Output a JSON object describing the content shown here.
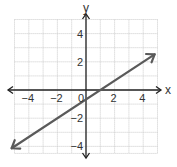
{
  "chart_data": {
    "type": "line",
    "title": "",
    "xlabel": "x",
    "ylabel": "y",
    "xlim": [
      -5,
      5
    ],
    "ylim": [
      -4.5,
      5
    ],
    "grid": true,
    "x_ticks_labeled": [
      -4,
      -2,
      0,
      2,
      4
    ],
    "y_ticks_labeled": [
      4,
      2,
      -2,
      -4
    ],
    "x_tick_labels": [
      "−4",
      "−2",
      "0",
      "2",
      "4"
    ],
    "y_tick_labels": [
      "4",
      "2",
      "−2",
      "−4"
    ],
    "series": [
      {
        "name": "line",
        "equation": "y = (2/3)x - 2/3",
        "slope": 0.6667,
        "intercept": -0.6667,
        "x": [
          -5.2,
          4.8
        ],
        "y": [
          -4.13,
          2.53
        ],
        "arrows_both_ends": true,
        "color": "#555555"
      }
    ],
    "annotations": [
      {
        "text": "0",
        "x": 0,
        "y": 0,
        "note": "origin label"
      }
    ]
  },
  "colors": {
    "grid": "#c8c8c8",
    "axis": "#222222",
    "line": "#5a5a5a",
    "text": "#333333"
  }
}
